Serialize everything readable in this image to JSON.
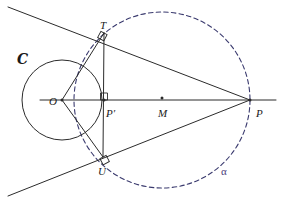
{
  "figure": {
    "width": 284,
    "height": 203,
    "background_color": "#ffffff",
    "stroke_color": "#2b2b2b",
    "dashed_color": "#3a3a6e",
    "alpha_label_color": "#4a3b7a"
  },
  "labels": {
    "circle_c": "C",
    "point_t": "T",
    "point_o": "O",
    "point_p_prime": "P′",
    "point_m": "M",
    "point_p": "P",
    "point_u": "U",
    "circle_alpha": "α"
  },
  "geometry": {
    "circle_c": {
      "name": "C",
      "center": {
        "x": 62,
        "y": 100
      },
      "radius": 40,
      "style": "solid",
      "label_position": {
        "x": 17,
        "y": 52
      }
    },
    "circle_alpha": {
      "name": "alpha",
      "center": {
        "x": 162,
        "y": 100
      },
      "radius": 88,
      "style": "dashed",
      "label_position": {
        "x": 221,
        "y": 166
      }
    },
    "points": [
      {
        "id": "T",
        "x": 104,
        "y": 33,
        "label_offset": {
          "x": -4,
          "y": -13
        },
        "dot": false
      },
      {
        "id": "U",
        "x": 103,
        "y": 157,
        "label_offset": {
          "x": -5,
          "y": 9
        },
        "dot": false
      },
      {
        "id": "O",
        "x": 62,
        "y": 100,
        "label_offset": {
          "x": -13,
          "y": -4
        },
        "dot": true
      },
      {
        "id": "Pprime",
        "x": 104,
        "y": 100,
        "label_offset": {
          "x": 2,
          "y": 8
        },
        "dot": true
      },
      {
        "id": "M",
        "x": 162,
        "y": 98,
        "label_offset": {
          "x": -4,
          "y": 10
        },
        "dot": true
      },
      {
        "id": "P",
        "x": 250,
        "y": 100,
        "label_offset": {
          "x": 6,
          "y": 8
        },
        "dot": true
      }
    ],
    "segments": [
      {
        "id": "tangent-upper",
        "from": {
          "x": 8,
          "y": 7
        },
        "to": {
          "x": 250,
          "y": 100
        }
      },
      {
        "id": "tangent-lower",
        "from": {
          "x": 8,
          "y": 196
        },
        "to": {
          "x": 250,
          "y": 100
        }
      },
      {
        "id": "axis-o-p",
        "from": {
          "x": 40,
          "y": 100
        },
        "to": {
          "x": 276,
          "y": 100
        }
      },
      {
        "id": "chord-t-u",
        "from": {
          "x": 104,
          "y": 33
        },
        "to": {
          "x": 103,
          "y": 157
        }
      },
      {
        "id": "radius-o-t",
        "from": {
          "x": 62,
          "y": 100
        },
        "to": {
          "x": 104,
          "y": 33
        }
      },
      {
        "id": "radius-o-u",
        "from": {
          "x": 62,
          "y": 100
        },
        "to": {
          "x": 103,
          "y": 157
        }
      }
    ],
    "right_angles": [
      {
        "id": "right-angle-t",
        "vertex": {
          "x": 104,
          "y": 33
        },
        "size": 7,
        "rotation": 28
      },
      {
        "id": "right-angle-u",
        "vertex": {
          "x": 103,
          "y": 157
        },
        "size": 7,
        "rotation": -28
      },
      {
        "id": "right-angle-p-prime",
        "vertex": {
          "x": 104,
          "y": 100
        },
        "size": 7,
        "rotation": 180
      }
    ]
  }
}
